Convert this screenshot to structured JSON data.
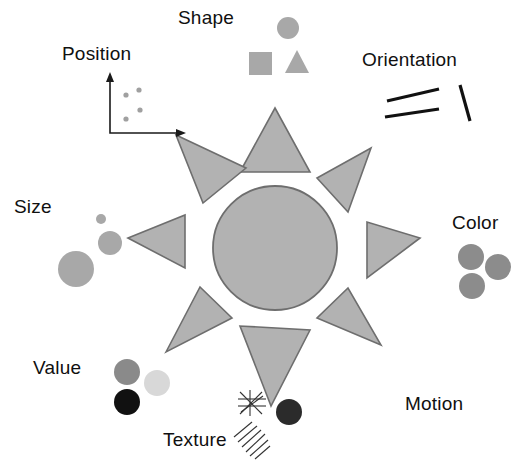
{
  "figure": {
    "title_present": false,
    "background_color": "#ffffff",
    "labels": [
      {
        "id": "shape",
        "text": "Shape",
        "x": 178,
        "y": 8,
        "icon": "shape-swatches"
      },
      {
        "id": "position",
        "text": "Position",
        "x": 62,
        "y": 44,
        "icon": "scatter-axes"
      },
      {
        "id": "orientation",
        "text": "Orientation",
        "x": 362,
        "y": 50,
        "icon": "angled-lines"
      },
      {
        "id": "size",
        "text": "Size",
        "x": 14,
        "y": 197,
        "icon": "graduated-circles"
      },
      {
        "id": "color",
        "text": "Color",
        "x": 452,
        "y": 213,
        "icon": "color-circles"
      },
      {
        "id": "value",
        "text": "Value",
        "x": 33,
        "y": 358,
        "icon": "value-circles"
      },
      {
        "id": "texture",
        "text": "Texture",
        "x": 163,
        "y": 430,
        "icon": "texture-hatch"
      },
      {
        "id": "motion",
        "text": "Motion",
        "x": 405,
        "y": 394,
        "icon": "motion-dot"
      }
    ],
    "colors": {
      "fill_gray": "#b2b2b2",
      "outline_gray": "#6e6e6e",
      "swatch_gray": "#a8a8a8",
      "color_circle": "#8c8c8c",
      "value_dark": "#8a8a8a",
      "value_light": "#d6d6d6",
      "value_black": "#111111",
      "line_black": "#111111",
      "motion_dot": "#2b2b2b",
      "axis_black": "#1a1a1a",
      "dot_gray": "#a0a0a0"
    },
    "sun": {
      "center_x": 275,
      "center_y": 248,
      "circle_radius": 62,
      "ray_count": 8,
      "description": "central filled circle surrounded by eight triangular rays"
    },
    "position_plot": {
      "axis_origin_x": 110,
      "axis_origin_y": 133,
      "points": [
        {
          "x": 126,
          "y": 95
        },
        {
          "x": 138,
          "y": 90
        },
        {
          "x": 140,
          "y": 110
        },
        {
          "x": 126,
          "y": 119
        }
      ]
    },
    "shape_swatches": [
      {
        "kind": "circle",
        "cx": 288,
        "cy": 28,
        "r": 11
      },
      {
        "kind": "square",
        "x": 249,
        "y": 52,
        "w": 22,
        "h": 22
      },
      {
        "kind": "triangle",
        "cx": 297,
        "cy": 63,
        "size": 22
      }
    ],
    "orientation_lines": [
      {
        "x1": 387,
        "y1": 100,
        "x2": 437,
        "y2": 90
      },
      {
        "x1": 385,
        "y1": 115,
        "x2": 438,
        "y2": 107
      },
      {
        "x1": 458,
        "y1": 85,
        "x2": 470,
        "y2": 120
      }
    ],
    "size_circles": [
      {
        "cx": 100,
        "cy": 219,
        "r": 5
      },
      {
        "cx": 110,
        "cy": 243,
        "r": 11
      },
      {
        "cx": 76,
        "cy": 268,
        "r": 18
      }
    ],
    "color_circles": [
      {
        "cx": 471,
        "cy": 256,
        "r": 13
      },
      {
        "cx": 497,
        "cy": 266,
        "r": 13
      },
      {
        "cx": 472,
        "cy": 285,
        "r": 13
      }
    ],
    "value_circles": [
      {
        "cx": 127,
        "cy": 372,
        "r": 13,
        "tone": "dark"
      },
      {
        "cx": 156,
        "cy": 382,
        "r": 13,
        "tone": "light"
      },
      {
        "cx": 127,
        "cy": 402,
        "r": 13,
        "tone": "black"
      }
    ],
    "texture_marks": {
      "crosshatch_x": 242,
      "crosshatch_y": 398,
      "hatch_x": 236,
      "hatch_y": 430
    },
    "motion_dot": {
      "cx": 288,
      "cy": 412,
      "r": 13
    }
  }
}
